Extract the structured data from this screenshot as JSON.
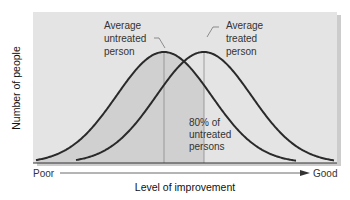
{
  "chart_data": {
    "type": "line",
    "title": "",
    "xlabel": "Level of improvement",
    "ylabel": "Number of people",
    "x_axis_start_label": "Poor",
    "x_axis_end_label": "Good",
    "grid": false,
    "series": [
      {
        "name": "Untreated persons",
        "distribution": "normal",
        "relative_mean": 0.0,
        "relative_sd": 1.0,
        "peak_label": "Average untreated person"
      },
      {
        "name": "Treated persons",
        "distribution": "normal",
        "relative_mean": 0.84,
        "relative_sd": 1.0,
        "peak_label": "Average treated person"
      }
    ],
    "annotations": [
      {
        "text": "Average untreated person",
        "points_to": "peak of untreated curve"
      },
      {
        "text": "Average treated person",
        "points_to": "peak of treated curve"
      },
      {
        "text": "80% of untreated persons",
        "describes": "shaded area under untreated curve left of treated mean"
      }
    ]
  },
  "labels": {
    "untreated_line1": "Average",
    "untreated_line2": "untreated",
    "untreated_line3": "person",
    "treated_line1": "Average",
    "treated_line2": "treated",
    "treated_line3": "person",
    "pct_line1": "80% of",
    "pct_line2": "untreated",
    "pct_line3": "persons",
    "poor": "Poor",
    "good": "Good",
    "xlabel": "Level of improvement",
    "ylabel": "Number of people"
  },
  "colors": {
    "panel": "#e4e4e4",
    "shade": "#d2d2d2",
    "curve": "#2a2a2a",
    "text": "#333333"
  }
}
